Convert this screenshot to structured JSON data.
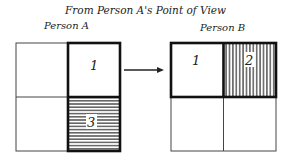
{
  "title": "From Person A's Point of View",
  "person_a": {
    "label": "Person A",
    "cells": [
      {
        "row": 0,
        "col": 0,
        "label": "",
        "highlighted": false,
        "pattern": "none"
      },
      {
        "row": 0,
        "col": 1,
        "label": "1",
        "highlighted": true,
        "pattern": "none"
      },
      {
        "row": 1,
        "col": 0,
        "label": "",
        "highlighted": false,
        "pattern": "none"
      },
      {
        "row": 1,
        "col": 1,
        "label": "3",
        "highlighted": true,
        "pattern": "horizontal-lines"
      }
    ]
  },
  "person_b": {
    "label": "Person B",
    "cells": [
      {
        "row": 0,
        "col": 0,
        "label": "1",
        "highlighted": true,
        "pattern": "none"
      },
      {
        "row": 0,
        "col": 1,
        "label": "2",
        "highlighted": true,
        "pattern": "vertical-lines"
      },
      {
        "row": 1,
        "col": 0,
        "label": "",
        "highlighted": false,
        "pattern": "none"
      },
      {
        "row": 1,
        "col": 1,
        "label": "",
        "highlighted": false,
        "pattern": "none"
      }
    ]
  },
  "arrow": {
    "from": "person_a",
    "to": "person_b",
    "icon": "arrow-right-icon"
  }
}
